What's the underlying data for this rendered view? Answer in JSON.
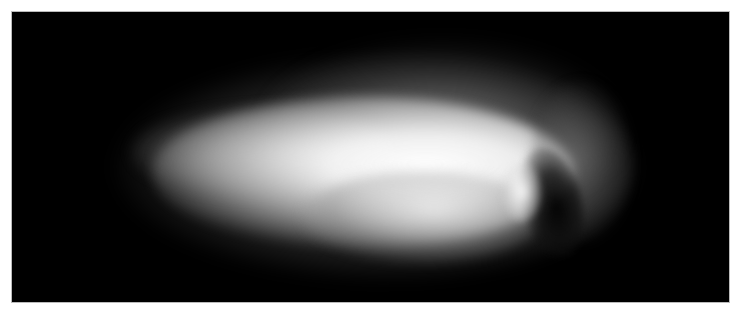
{
  "image": {
    "subject": "comet nucleus with bright coma against black space",
    "background_color": "#000000",
    "border_color": "#ffffff",
    "highlight_color": "#ffffff"
  }
}
